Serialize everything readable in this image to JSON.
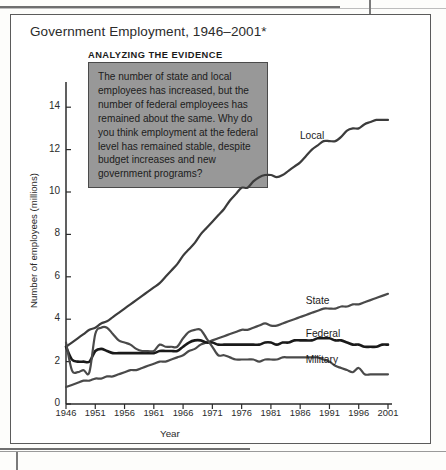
{
  "figure": {
    "title": "Government Employment, 1946–2001*",
    "callout_heading": "ANALYZING THE EVIDENCE",
    "callout_text": "The number of state and local employees has increased, but the number of federal employees has remained about the same. Why do you think employment at the federal level has remained stable, despite budget increases and new government programs?",
    "callout_bg": "#989898",
    "callout_border": "#4a4a4a",
    "frame_border": "#5b5b5b"
  },
  "chart_data": {
    "type": "line",
    "title": "Government Employment, 1946–2001*",
    "xlabel": "Year",
    "ylabel": "Number of employees (millions)",
    "xlim": [
      1946,
      2001
    ],
    "ylim": [
      0,
      15
    ],
    "yticks": [
      0,
      2,
      4,
      6,
      8,
      10,
      12,
      14
    ],
    "xticks": [
      1946,
      1951,
      1956,
      1961,
      1966,
      1971,
      1976,
      1981,
      1986,
      1991,
      1996,
      2001
    ],
    "grid": false,
    "legend": "inline-labels-right",
    "x": [
      1946,
      1947,
      1948,
      1949,
      1950,
      1951,
      1952,
      1953,
      1954,
      1955,
      1956,
      1957,
      1958,
      1959,
      1960,
      1961,
      1962,
      1963,
      1964,
      1965,
      1966,
      1967,
      1968,
      1969,
      1970,
      1971,
      1972,
      1973,
      1974,
      1975,
      1976,
      1977,
      1978,
      1979,
      1980,
      1981,
      1982,
      1983,
      1984,
      1985,
      1986,
      1987,
      1988,
      1989,
      1990,
      1991,
      1992,
      1993,
      1994,
      1995,
      1996,
      1997,
      1998,
      1999,
      2000,
      2001
    ],
    "series": [
      {
        "name": "Local",
        "color": "#3c3c3c",
        "label_x": 1988,
        "label_y": 12.6,
        "values": [
          2.7,
          2.9,
          3.1,
          3.3,
          3.5,
          3.6,
          3.8,
          3.9,
          4.1,
          4.3,
          4.5,
          4.7,
          4.9,
          5.1,
          5.3,
          5.5,
          5.7,
          6.0,
          6.3,
          6.6,
          7.0,
          7.3,
          7.6,
          8.0,
          8.3,
          8.6,
          8.9,
          9.2,
          9.6,
          9.9,
          10.2,
          10.2,
          10.5,
          10.7,
          10.8,
          10.8,
          10.7,
          10.8,
          11.0,
          11.2,
          11.4,
          11.7,
          12.0,
          12.2,
          12.4,
          12.4,
          12.4,
          12.6,
          12.9,
          13.0,
          13.0,
          13.2,
          13.3,
          13.4,
          13.4,
          13.4
        ]
      },
      {
        "name": "State",
        "color": "#4a4a4a",
        "label_x": 1989,
        "label_y": 4.8,
        "values": [
          0.8,
          0.9,
          1.0,
          1.1,
          1.1,
          1.2,
          1.2,
          1.3,
          1.3,
          1.4,
          1.5,
          1.6,
          1.6,
          1.7,
          1.8,
          1.9,
          2.0,
          2.0,
          2.1,
          2.2,
          2.3,
          2.5,
          2.6,
          2.8,
          2.9,
          3.0,
          3.1,
          3.2,
          3.3,
          3.4,
          3.5,
          3.5,
          3.6,
          3.7,
          3.8,
          3.7,
          3.7,
          3.8,
          3.9,
          4.0,
          4.1,
          4.2,
          4.3,
          4.4,
          4.5,
          4.5,
          4.5,
          4.6,
          4.6,
          4.7,
          4.7,
          4.8,
          4.9,
          5.0,
          5.1,
          5.2
        ]
      },
      {
        "name": "Federal",
        "color": "#1a1a1a",
        "label_x": 1989,
        "label_y": 3.25,
        "values": [
          2.7,
          2.1,
          2.0,
          2.0,
          2.0,
          2.5,
          2.6,
          2.5,
          2.4,
          2.4,
          2.4,
          2.4,
          2.4,
          2.4,
          2.4,
          2.4,
          2.5,
          2.5,
          2.5,
          2.5,
          2.7,
          2.9,
          3.0,
          3.0,
          2.9,
          2.9,
          2.8,
          2.8,
          2.8,
          2.8,
          2.8,
          2.8,
          2.8,
          2.8,
          2.9,
          2.9,
          2.8,
          2.9,
          2.9,
          3.0,
          3.0,
          3.0,
          3.0,
          3.1,
          3.1,
          3.1,
          3.0,
          3.0,
          2.9,
          2.8,
          2.8,
          2.7,
          2.7,
          2.7,
          2.8,
          2.8
        ]
      },
      {
        "name": "Military",
        "color": "#4a4a4a",
        "label_x": 1989,
        "label_y": 2.05,
        "values": [
          2.9,
          1.6,
          1.5,
          1.6,
          1.5,
          3.3,
          3.6,
          3.6,
          3.3,
          3.0,
          2.9,
          2.8,
          2.6,
          2.5,
          2.5,
          2.5,
          2.8,
          2.7,
          2.7,
          2.7,
          3.1,
          3.4,
          3.5,
          3.5,
          3.1,
          2.7,
          2.3,
          2.3,
          2.2,
          2.1,
          2.1,
          2.1,
          2.1,
          2.0,
          2.1,
          2.1,
          2.1,
          2.2,
          2.2,
          2.2,
          2.2,
          2.2,
          2.2,
          2.2,
          2.1,
          2.0,
          1.8,
          1.7,
          1.6,
          1.5,
          1.7,
          1.4,
          1.4,
          1.4,
          1.4,
          1.4
        ]
      }
    ]
  },
  "axes": {
    "y_title": "Number of employees (millions)",
    "x_title": "Year",
    "y_tick_labels": [
      "0",
      "2",
      "4",
      "6",
      "8",
      "10",
      "12",
      "14"
    ],
    "x_tick_labels": [
      "1946",
      "1951",
      "1956",
      "1961",
      "1966",
      "1971",
      "1976",
      "1981",
      "1986",
      "1991",
      "1996",
      "2001"
    ]
  }
}
